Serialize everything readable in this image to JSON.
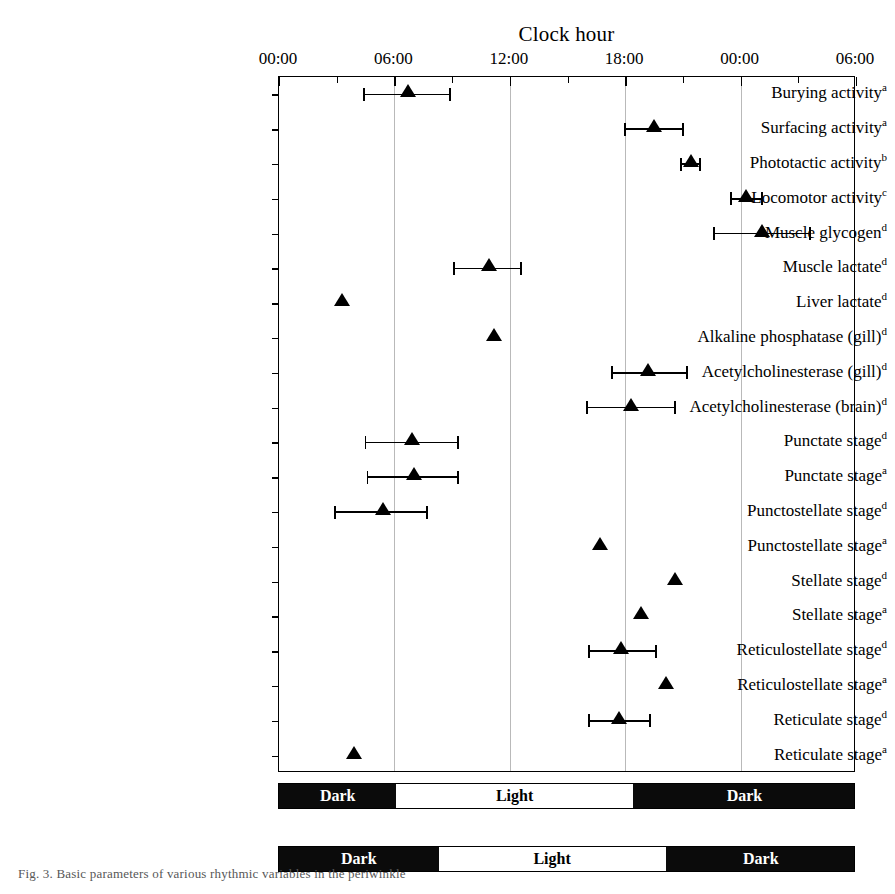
{
  "chart_data": {
    "type": "scatter",
    "title": "Clock hour",
    "xlabel": "Clock hour",
    "ylabel": "",
    "orientation": "horizontal",
    "grid": true,
    "legend_position": "none",
    "xlim": [
      0,
      30
    ],
    "xtick_values": [
      0,
      6,
      12,
      18,
      24,
      30
    ],
    "xtick_labels": [
      "00:00",
      "06:00",
      "12:00",
      "18:00",
      "00:00",
      "06:00"
    ],
    "minor_tick_values": [
      3,
      9,
      15,
      21,
      27
    ],
    "units": "clock hour (h)",
    "marker_style": "filled-triangle",
    "categories": [
      "Burying activity",
      "Surfacing activity",
      "Phototactic activity",
      "Locomotor activity",
      "Muscle glycogen",
      "Muscle lactate",
      "Liver lactate",
      "Alkaline phosphatase (gill)",
      "Acetylcholinesterase (gill)",
      "Acetylcholinesterase (brain)",
      "Punctate stage",
      "Punctate stage",
      "Punctostellate stage",
      "Punctostellate stage",
      "Stellate stage",
      "Stellate stage",
      "Reticulostellate stage",
      "Reticulostellate stage",
      "Reticulate stage",
      "Reticulate stage"
    ],
    "points": [
      {
        "label": "Burying activity",
        "sup": "a",
        "acrophase": 6.7,
        "ci_low": 4.4,
        "ci_high": 8.9,
        "has_error": true
      },
      {
        "label": "Surfacing activity",
        "sup": "a",
        "acrophase": 19.5,
        "ci_low": 18.0,
        "ci_high": 21.0,
        "has_error": true
      },
      {
        "label": "Phototactic activity",
        "sup": "b",
        "acrophase": 21.4,
        "ci_low": 20.9,
        "ci_high": 21.9,
        "has_error": true
      },
      {
        "label": "Locomotor activity",
        "sup": "c",
        "acrophase": 24.3,
        "ci_low": 23.5,
        "ci_high": 25.1,
        "has_error": true
      },
      {
        "label": "Muscle glycogen",
        "sup": "d",
        "acrophase": 25.1,
        "ci_low": 22.6,
        "ci_high": 27.6,
        "has_error": true
      },
      {
        "label": "Muscle lactate",
        "sup": "d",
        "acrophase": 10.9,
        "ci_low": 9.1,
        "ci_high": 12.6,
        "has_error": true
      },
      {
        "label": "Liver lactate",
        "sup": "d",
        "acrophase": 3.3,
        "ci_low": null,
        "ci_high": null,
        "has_error": false
      },
      {
        "label": "Alkaline phosphatase (gill)",
        "sup": "d",
        "acrophase": 11.2,
        "ci_low": null,
        "ci_high": null,
        "has_error": false
      },
      {
        "label": "Acetylcholinesterase (gill)",
        "sup": "d",
        "acrophase": 19.2,
        "ci_low": 17.3,
        "ci_high": 21.2,
        "has_error": true
      },
      {
        "label": "Acetylcholinesterase (brain)",
        "sup": "d",
        "acrophase": 18.3,
        "ci_low": 16.0,
        "ci_high": 20.6,
        "has_error": true
      },
      {
        "label": "Punctate stage",
        "sup": "d",
        "acrophase": 6.9,
        "ci_low": 4.5,
        "ci_high": 9.3,
        "has_error": true
      },
      {
        "label": "Punctate stage",
        "sup": "a",
        "acrophase": 7.0,
        "ci_low": 4.6,
        "ci_high": 9.3,
        "has_error": true
      },
      {
        "label": "Punctostellate stage",
        "sup": "d",
        "acrophase": 5.4,
        "ci_low": 2.9,
        "ci_high": 7.7,
        "has_error": true
      },
      {
        "label": "Punctostellate stage",
        "sup": "a",
        "acrophase": 16.7,
        "ci_low": null,
        "ci_high": null,
        "has_error": false
      },
      {
        "label": "Stellate stage",
        "sup": "d",
        "acrophase": 20.6,
        "ci_low": null,
        "ci_high": null,
        "has_error": false
      },
      {
        "label": "Stellate stage",
        "sup": "a",
        "acrophase": 18.8,
        "ci_low": null,
        "ci_high": null,
        "has_error": false
      },
      {
        "label": "Reticulostellate stage",
        "sup": "d",
        "acrophase": 17.8,
        "ci_low": 16.1,
        "ci_high": 19.6,
        "has_error": true
      },
      {
        "label": "Reticulostellate stage",
        "sup": "a",
        "acrophase": 20.1,
        "ci_low": null,
        "ci_high": null,
        "has_error": false
      },
      {
        "label": "Reticulate stage",
        "sup": "d",
        "acrophase": 17.7,
        "ci_low": 16.1,
        "ci_high": 19.3,
        "has_error": true
      },
      {
        "label": "Reticulate stage",
        "sup": "a",
        "acrophase": 3.9,
        "ci_low": null,
        "ci_high": null,
        "has_error": false
      }
    ],
    "photoperiod_bars": [
      {
        "name": "photoperiod-bar-upper",
        "segments": [
          {
            "label": "Dark",
            "start": 0,
            "end": 6.1,
            "shade": "dark"
          },
          {
            "label": "Light",
            "start": 6.1,
            "end": 18.4,
            "shade": "light"
          },
          {
            "label": "Dark",
            "start": 18.4,
            "end": 30,
            "shade": "dark"
          }
        ]
      },
      {
        "name": "photoperiod-bar-lower",
        "segments": [
          {
            "label": "Dark",
            "start": 0,
            "end": 8.3,
            "shade": "dark"
          },
          {
            "label": "Light",
            "start": 8.3,
            "end": 20.1,
            "shade": "light"
          },
          {
            "label": "Dark",
            "start": 20.1,
            "end": 30,
            "shade": "dark"
          }
        ]
      }
    ]
  },
  "caption": "Fig. 3.  Basic parameters of various rhythmic variables in the periwinkle"
}
